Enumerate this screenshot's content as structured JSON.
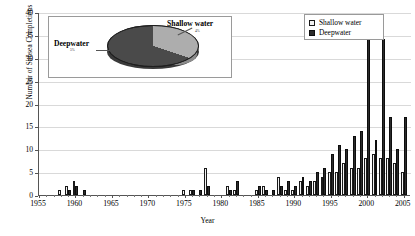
{
  "chart_data": {
    "type": "bar",
    "title": "",
    "xlabel": "Year",
    "ylabel": "Number of Subsea Completions",
    "ylim": [
      0,
      40
    ],
    "ytick_step": 5,
    "yticks": [
      0,
      5,
      10,
      15,
      20,
      25,
      30,
      35,
      40
    ],
    "xlim": [
      1955,
      2006
    ],
    "xticks": [
      1955,
      1960,
      1965,
      1970,
      1975,
      1980,
      1985,
      1990,
      1995,
      2000,
      2005
    ],
    "grid": true,
    "legend_position": "top-right",
    "x": [
      1955,
      1956,
      1957,
      1958,
      1959,
      1960,
      1961,
      1962,
      1963,
      1964,
      1965,
      1966,
      1967,
      1968,
      1969,
      1970,
      1971,
      1972,
      1973,
      1974,
      1975,
      1976,
      1977,
      1978,
      1979,
      1980,
      1981,
      1982,
      1983,
      1984,
      1985,
      1986,
      1987,
      1988,
      1989,
      1990,
      1991,
      1992,
      1993,
      1994,
      1995,
      1996,
      1997,
      1998,
      1999,
      2000,
      2001,
      2002,
      2003,
      2004,
      2005
    ],
    "series": [
      {
        "name": "Shallow water",
        "color": "#f2f2f2",
        "values": [
          0,
          0,
          0,
          1,
          2,
          3,
          0,
          0,
          0,
          0,
          0,
          0,
          0,
          0,
          0,
          0,
          0,
          0,
          0,
          0,
          1,
          1,
          0,
          6,
          0,
          0,
          2,
          1,
          0,
          0,
          1,
          2,
          0,
          4,
          1,
          1,
          3,
          2,
          3,
          4,
          5,
          5,
          7,
          6,
          6,
          8,
          9,
          8,
          8,
          7,
          5
        ]
      },
      {
        "name": "Deepwater",
        "color": "#2b2b2b",
        "values": [
          0,
          0,
          0,
          0,
          1,
          2,
          1,
          0,
          0,
          0,
          0,
          0,
          0,
          0,
          0,
          0,
          0,
          0,
          0,
          0,
          0,
          1,
          1,
          2,
          0,
          0,
          1,
          3,
          0,
          0,
          2,
          1,
          1,
          2,
          3,
          2,
          4,
          3,
          5,
          6,
          9,
          11,
          10,
          13,
          14,
          36,
          12,
          34,
          17,
          10,
          17
        ]
      }
    ]
  },
  "legend": {
    "items": [
      {
        "label": "Shallow water",
        "swatch": "shallow"
      },
      {
        "label": "Deepwater",
        "swatch": "deep"
      }
    ]
  },
  "pie_inset": {
    "type": "pie",
    "slices": [
      {
        "label": "Shallow water",
        "percent": "4%",
        "color": "#adadad"
      },
      {
        "label": "Deepwater",
        "percent": "5%",
        "color": "#4a4a4a"
      }
    ]
  }
}
